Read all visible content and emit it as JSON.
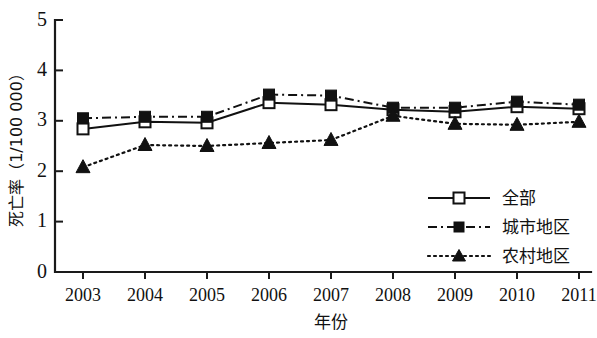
{
  "chart_data": {
    "type": "line",
    "title": "",
    "xlabel": "年份",
    "ylabel": "死亡率（1/100 000）",
    "x": [
      2003,
      2004,
      2005,
      2006,
      2007,
      2008,
      2009,
      2010,
      2011
    ],
    "xtick_labels": [
      "2003",
      "2004",
      "2005",
      "2006",
      "2007",
      "2008",
      "2009",
      "2010",
      "2011"
    ],
    "ytick_labels": [
      "0",
      "1",
      "2",
      "3",
      "4",
      "5"
    ],
    "ytick_values": [
      0,
      1,
      2,
      3,
      4,
      5
    ],
    "ylim": [
      0,
      5
    ],
    "xlim": [
      2003,
      2011
    ],
    "grid": false,
    "legend_position": "lower-right",
    "series": [
      {
        "name": "全部",
        "marker": "open-square",
        "linestyle": "solid",
        "values": [
          2.84,
          2.98,
          2.96,
          3.36,
          3.32,
          3.22,
          3.18,
          3.28,
          3.24
        ]
      },
      {
        "name": "城市地区",
        "marker": "filled-square",
        "linestyle": "dash-dot",
        "values": [
          3.05,
          3.08,
          3.08,
          3.52,
          3.5,
          3.26,
          3.26,
          3.38,
          3.32
        ]
      },
      {
        "name": "农村地区",
        "marker": "filled-triangle",
        "linestyle": "dotted",
        "values": [
          2.08,
          2.52,
          2.5,
          2.56,
          2.62,
          3.1,
          2.94,
          2.92,
          2.98
        ]
      }
    ]
  },
  "colors": {
    "ink": "#111111",
    "background": "#ffffff"
  }
}
